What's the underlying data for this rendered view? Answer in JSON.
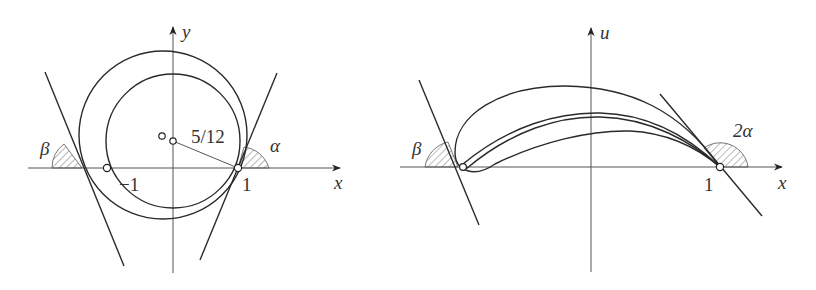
{
  "figures": [
    {
      "id": "left",
      "title": "z-plane circles",
      "axes": {
        "x_label": "x",
        "y_label": "y"
      },
      "labels": {
        "minus_one": "−1",
        "one": "1",
        "radius_note": "5/12",
        "angle_alpha": "α",
        "angle_beta": "β"
      }
    },
    {
      "id": "right",
      "title": "mapped airfoil profile",
      "axes": {
        "x_label": "x",
        "y_label": "u"
      },
      "labels": {
        "one": "1",
        "angle_two_alpha": "2α",
        "angle_beta": "β"
      }
    }
  ],
  "colors": {
    "stroke": "#2a2a2a",
    "axis": "#555555",
    "background": "#ffffff"
  }
}
